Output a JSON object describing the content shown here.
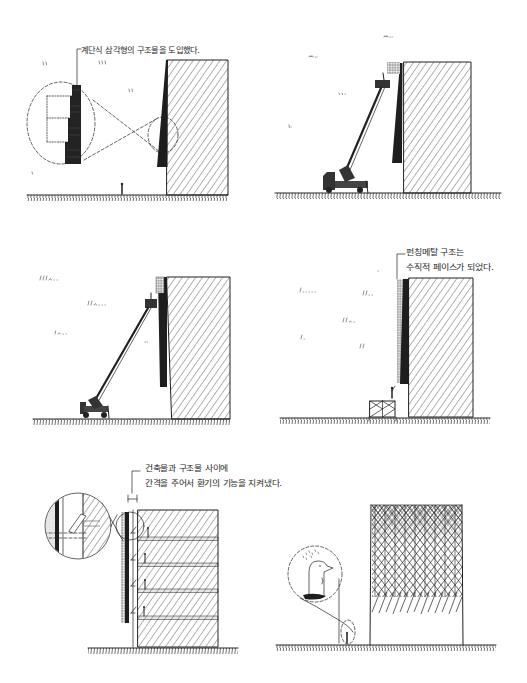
{
  "colors": {
    "paper": "#ffffff",
    "ink": "#222222"
  },
  "panels": [
    {
      "annotation": [
        "계단식 삼각형의 구조물을 도입했다."
      ],
      "depicts": [
        "building",
        "stepped-triangle-structure",
        "magnified-detail-circle",
        "person",
        "ground"
      ]
    },
    {
      "annotation": [],
      "depicts": [
        "building",
        "triangle-structure",
        "punched-metal-panel",
        "crane-truck",
        "ground"
      ]
    },
    {
      "annotation": [],
      "depicts": [
        "building",
        "punched-metal-strip",
        "aerial-lift",
        "ground"
      ]
    },
    {
      "annotation": [
        "펀칭메탈 구조는",
        "수직적 페이스가 되었다."
      ],
      "depicts": [
        "building",
        "punched-metal-facade",
        "person",
        "scaffold",
        "ground"
      ]
    },
    {
      "annotation": [
        "건축물과 구조물 사이에",
        "간격을 주어서 환기의 기능을 지켜냈다."
      ],
      "depicts": [
        "building-section",
        "floor-slabs",
        "ventilation-gap",
        "magnified-detail-circle",
        "people",
        "ground"
      ]
    },
    {
      "annotation": [],
      "depicts": [
        "lattice-facade-building",
        "penguin-thought-bubble",
        "person",
        "ground"
      ]
    }
  ]
}
